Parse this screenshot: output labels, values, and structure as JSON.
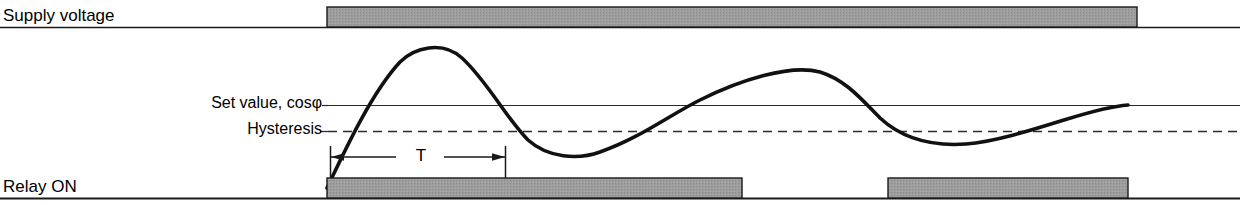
{
  "diagram": {
    "labels": {
      "supply_voltage": "Supply voltage",
      "relay_on": "Relay ON",
      "set_value": "Set value, cosφ",
      "hysteresis": "Hysteresis",
      "period": "T"
    },
    "colors": {
      "bar_fill": "#9a9a9a",
      "bar_stroke": "#1a1a1a",
      "curve": "#111111",
      "axis": "#1a1a1a",
      "reference_line": "#2a2a2a",
      "background": "#ffffff"
    },
    "axes": {
      "supply_baseline_y": 27,
      "relay_baseline_y": 198,
      "set_value_line_y": 105,
      "hysteresis_line_y": 131,
      "lines_start_x": 328,
      "lines_end_x": 1240,
      "baseline_start_x": 0,
      "baseline_end_x": 1240
    },
    "supply_voltage_bar": {
      "x": 327,
      "y": 7,
      "width": 810,
      "height": 20,
      "state": "ON"
    },
    "relay_bars": [
      {
        "x": 327,
        "y": 178,
        "width": 415,
        "height": 20,
        "state": "ON"
      },
      {
        "x": 888,
        "y": 178,
        "width": 240,
        "height": 20,
        "state": "ON"
      }
    ],
    "period_marker": {
      "label": "T",
      "start_x": 330,
      "end_x": 505,
      "y": 157,
      "tick_top_y": 146,
      "tick_bottom_y": 178
    },
    "curve": {
      "description": "Damped oscillating power factor signal crossing set value and hysteresis thresholds",
      "start": {
        "x": 327,
        "y": 188
      },
      "end": {
        "x": 1128,
        "y": 105
      },
      "extrema": [
        {
          "type": "peak",
          "x": 428,
          "y": 45
        },
        {
          "type": "trough",
          "x": 588,
          "y": 155
        },
        {
          "type": "peak",
          "x": 825,
          "y": 72
        },
        {
          "type": "trough",
          "x": 1000,
          "y": 140
        }
      ],
      "path": "M 327 188 C 345 150 372 92 400 62 C 414 48 442 40 462 58 C 488 82 506 118 528 140 C 548 158 578 160 600 152 C 640 138 668 116 700 100 C 740 80 790 64 820 72 C 846 80 862 100 880 118 C 906 142 938 146 966 144 C 994 142 1032 130 1064 120 C 1090 112 1112 106 1128 105"
    }
  }
}
